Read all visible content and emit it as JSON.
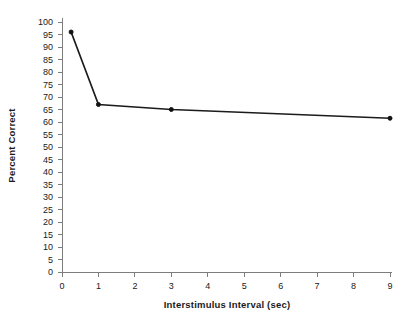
{
  "chart_data": {
    "type": "line",
    "title": "",
    "xlabel": "Interstimulus Interval (sec)",
    "ylabel": "Percent Correct",
    "x": [
      0.25,
      1,
      3,
      9
    ],
    "values": [
      96,
      67,
      65,
      61.5
    ],
    "series": [
      {
        "name": "Percent Correct",
        "x": [
          0.25,
          1,
          3,
          9
        ],
        "values": [
          96,
          67,
          65,
          61.5
        ]
      }
    ],
    "xlim": [
      0,
      9
    ],
    "ylim": [
      0,
      100
    ],
    "xticks": [
      0,
      1,
      2,
      3,
      4,
      5,
      6,
      7,
      8,
      9
    ],
    "yticks": [
      0,
      5,
      10,
      15,
      20,
      25,
      30,
      35,
      40,
      45,
      50,
      55,
      60,
      65,
      70,
      75,
      80,
      85,
      90,
      95,
      100
    ],
    "xtick_labels": [
      "0",
      "1",
      "2",
      "3",
      "4",
      "5",
      "6",
      "7",
      "8",
      "9"
    ],
    "ytick_labels": [
      "0",
      "5",
      "10",
      "15",
      "20",
      "25",
      "30",
      "35",
      "40",
      "45",
      "50",
      "55",
      "60",
      "65",
      "70",
      "75",
      "80",
      "85",
      "90",
      "95",
      "100"
    ],
    "grid": false,
    "legend": false,
    "marker": "dot",
    "line_color": "#1b1b1b",
    "axis_color": "#7d7d7d",
    "background": "#ffffff"
  }
}
